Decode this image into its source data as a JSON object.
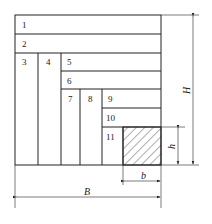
{
  "diagram": {
    "type": "nested rectangular layout with dimensions",
    "regions": [
      {
        "id": "1",
        "label": "1"
      },
      {
        "id": "2",
        "label": "2"
      },
      {
        "id": "3",
        "label": "3"
      },
      {
        "id": "4",
        "label": "4"
      },
      {
        "id": "5",
        "label": "5"
      },
      {
        "id": "6",
        "label": "6"
      },
      {
        "id": "7",
        "label": "7"
      },
      {
        "id": "8",
        "label": "8"
      },
      {
        "id": "9",
        "label": "9"
      },
      {
        "id": "10",
        "label": "10"
      },
      {
        "id": "11",
        "label": "11"
      }
    ],
    "hatched_region": "remaining b × h area",
    "dimensions": {
      "H": "H",
      "h": "h",
      "b": "b",
      "B": "B"
    }
  }
}
